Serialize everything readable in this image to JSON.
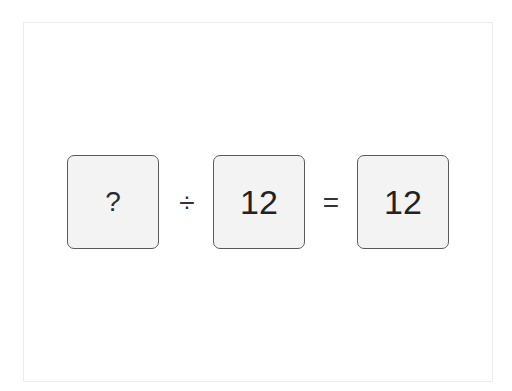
{
  "puzzle": {
    "type": "equation",
    "operands": [
      {
        "value": "?",
        "role": "unknown"
      },
      {
        "value": "12",
        "role": "divisor"
      },
      {
        "value": "12",
        "role": "result"
      }
    ],
    "operators": [
      "÷",
      "="
    ],
    "expression": "? ÷ 12 = 12"
  },
  "colors": {
    "tile_fill": "#f3f3f3",
    "tile_border": "#5a5a5a",
    "text": "#222222",
    "frame_border": "#ececec"
  }
}
